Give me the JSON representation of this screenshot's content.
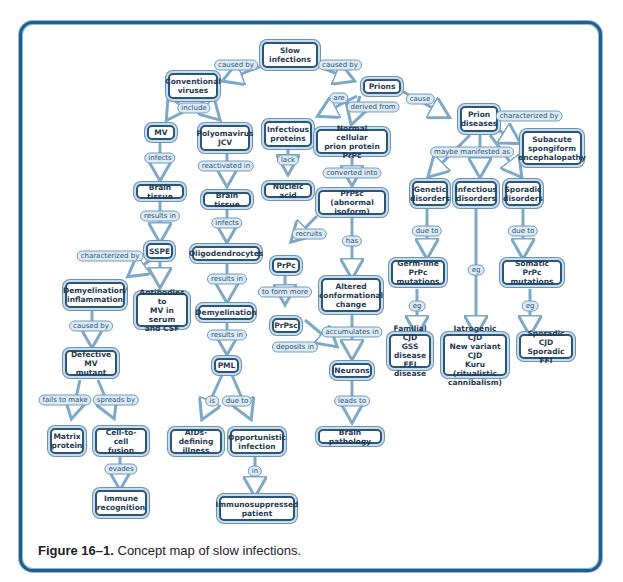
{
  "figure": {
    "caption_label": "Figure 16–1.",
    "caption_text": " Concept map of slow infections.",
    "colors": {
      "frame": "#1e5f8c",
      "node_border": "#2a5678",
      "link_fill": "#dde9f3",
      "arrow": "#7ea8c8"
    }
  },
  "nodes": {
    "slow_infections": "Slow\ninfections",
    "conventional_viruses": "Conventional\nviruses",
    "prions": "Prions",
    "mv": "MV",
    "polyomavirus": "Polyomavirus\nJCV",
    "infectious_proteins": "Infectious\nproteins",
    "normal_prpc": "Normal cellular\nprion protein PrPc",
    "prion_diseases": "Prion\ndiseases",
    "subacute": "Subacute\nspongiform\nencephalopathy",
    "brain_tissue_1": "Brain tissue",
    "brain_tissue_2": "Brain tissue",
    "nucleic_acid": "Nucleic acid",
    "prpsc_abnormal": "PrPsc (abnormal\nisoform)",
    "genetic_disorders": "Genetic\ndisorders",
    "infectious_disorders": "Infectious\ndisorders",
    "sporadic_disorders": "Sporadic\ndisorders",
    "sspe": "SSPE",
    "oligodendrocytes": "Oligodendrocytes",
    "prpc": "PrPc",
    "germline": "Germ-line\nPrPc mutations",
    "somatic": "Somatic\nPrPc mutations",
    "demyelination_inflammation": "Demyelination/\ninflammation",
    "antibodies": "Antibodies to\nMV in serum\nand CSF",
    "demyelination": "Demyelination",
    "prpsc": "PrPsc",
    "altered": "Altered\nconformational\nchange",
    "familial": "Familial CJD\nGSS disease\nFFI disease",
    "iatrogenic": "Iatrogenic CJD\nNew variant CJD\nKuru (ritualistic\ncannibalism)",
    "sporadic_cjd": "Sporadic CJD\nSporadic FFI",
    "defective_mv": "Defective\nMV mutant",
    "pml": "PML",
    "neurons": "Neurons",
    "brain_pathology": "Brain pathology",
    "matrix_protein": "Matrix\nprotein",
    "cell_fusion": "Cell-to-cell\nfusion",
    "aids_illness": "AIDs-defining\nillness",
    "opportunistic": "Opportunistic\ninfection",
    "immune_recognition": "Immune\nrecognition",
    "immunosuppressed": "Immunosuppressed\npatient"
  },
  "links": {
    "caused_by_left": "caused by",
    "caused_by_right": "caused by",
    "include": "include",
    "are": "are",
    "derived_from": "derived from",
    "cause": "cause",
    "characterized_by_prion": "characterized by",
    "infects_mv": "infects",
    "reactivated_in": "reactivated in",
    "lack": "lack",
    "converted_into": "converted into",
    "maybe_manifested_as": "maybe manifested as",
    "results_in_sspe": "results in",
    "infects_olig": "infects",
    "recruits": "recruits",
    "has": "has",
    "due_to_genetic": "due to",
    "eg_infectious": "eg",
    "due_to_sporadic": "due to",
    "characterized_by_sspe": "characterized by",
    "results_in_demy": "results in",
    "to_form_more": "to form more",
    "eg_germline": "eg",
    "eg_somatic": "eg",
    "caused_by_defective": "caused by",
    "results_in_pml": "results in",
    "deposits_in": "deposits in",
    "accumulates_in": "accumulates in",
    "leads_to": "leads to",
    "fails_to_make": "fails to make",
    "spreads_by": "spreads by",
    "is": "is",
    "due_to_pml": "due to",
    "evades": "evades",
    "in": "in"
  }
}
